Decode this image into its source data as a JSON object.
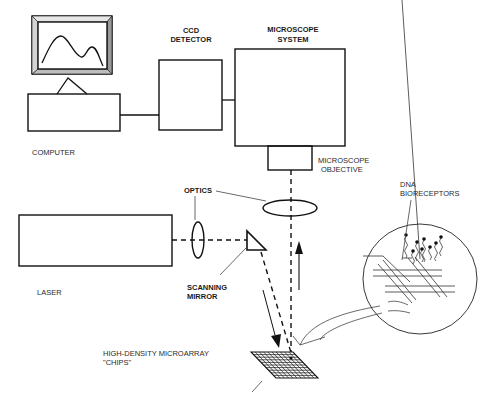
{
  "diagram": {
    "labels": {
      "ccd_line1": "CCD",
      "ccd_line2": "DETECTOR",
      "microscope_system_line1": "MICROSCOPE",
      "microscope_system_line2": "SYSTEM",
      "computer": "COMPUTER",
      "microscope_objective_line1": "MICROSCOPE",
      "microscope_objective_line2": "OBJECTIVE",
      "optics": "OPTICS",
      "dna_line1": "DNA",
      "dna_line2": "BIORECEPTORS",
      "laser": "LASER",
      "scanning_mirror_line1": "SCANNING",
      "scanning_mirror_line2": "MIRROR",
      "chips_line1": "HIGH-DENSITY MICROARRAY",
      "chips_line2": "\"CHIPS\""
    },
    "components": [
      "computer",
      "ccd-detector",
      "microscope-system",
      "microscope-objective",
      "optics",
      "laser",
      "scanning-mirror",
      "microarray-chip",
      "dna-bioreceptors-inset"
    ],
    "colors": {
      "line": "#111111",
      "monitor_bevel": "#9a9a9a",
      "background": "#ffffff"
    }
  }
}
